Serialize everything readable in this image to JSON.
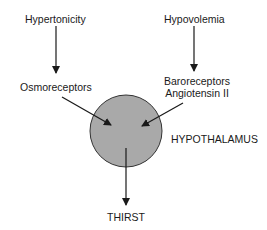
{
  "diagram": {
    "nodes": {
      "hypertonicity": "Hypertonicity",
      "hypovolemia": "Hypovolemia",
      "osmoreceptors": "Osmoreceptors",
      "baroreceptors": "Baroreceptors",
      "angiotensin": "Angiotensin II",
      "hypothalamus": "HYPOTHALAMUS",
      "thirst": "THIRST"
    },
    "colors": {
      "circle_fill": "#a9a9a9",
      "circle_stroke": "#333333",
      "arrow": "#1a1a1a"
    }
  }
}
